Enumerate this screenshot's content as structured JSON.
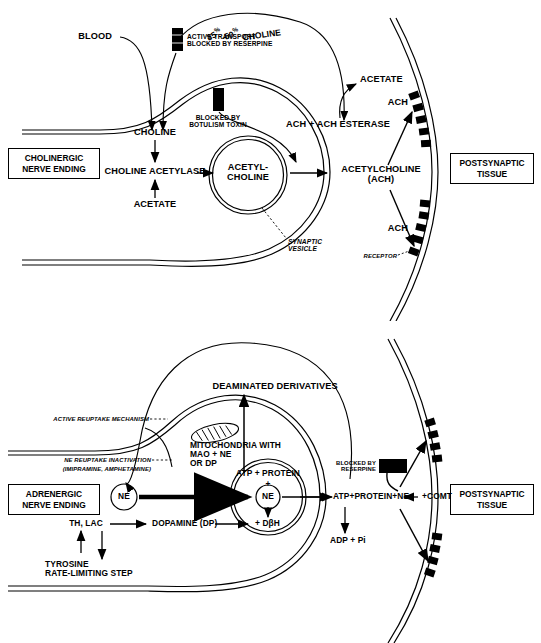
{
  "figure": {
    "type": "biological-diagram",
    "panels": [
      {
        "id": "cholinergic",
        "title_box_left": "CHOLINERGIC\nNERVE ENDING",
        "title_box_right": "POSTSYNAPTIC\nTISSUE",
        "labels": {
          "blood": "BLOOD",
          "choline_percent_prefix": "35",
          "choline_percent_mid": "-50",
          "choline_percent_suffix": " CHOLINE",
          "percent_glyph": "%",
          "active_transport": "ACTIVE TRANSPORT\nBLOCKED BY RESERPINE",
          "blocked_botulism": "BLOCKED BY\nBOTULISM TOXIN",
          "choline": "CHOLINE",
          "choline_acetylase": "CHOLINE ACETYLASE",
          "acetate_left": "ACETATE",
          "acetyl_choline_vesicle": "ACETYL-\nCHOLINE",
          "acetylcholine_ach": "ACETYLCHOLINE\n(ACH)",
          "ach_ach_esterase": "ACH + ACH ESTERASE",
          "acetate_right": "ACETATE",
          "ach_upper": "ACH",
          "ach_lower": "ACH",
          "synaptic_vesicle": "SYNAPTIC\nVESICLE",
          "receptor": "RECEPTOR"
        }
      },
      {
        "id": "adrenergic",
        "title_box_left": "ADRENERGIC\nNERVE ENDING",
        "title_box_right": "POSTSYNAPTIC\nTISSUE",
        "labels": {
          "deaminated_derivatives": "DEAMINATED DERIVATIVES",
          "active_reuptake": "ACTIVE REUPTAKE MECHANISM",
          "ne_reuptake_inactivation": "NE REUPTAKE INACTIVATION",
          "ne_reuptake_drugs": "(IMIPRAMINE, AMPHETAMINE)",
          "mitochondria": "MITOCHONDRIA WITH\nMAO + NE\nOR DP",
          "blocked_reserpine": "BLOCKED BY\nRESERPINE",
          "atp_protein": "ATP + PROTEIN",
          "plus_sign": "+",
          "ne_vesicle": "NE",
          "ne_cytosol": "NE",
          "dbh": "+ DβH",
          "atp_protein_ne_comt": "ATP+PROTEIN+NE",
          "comt": "+COMT",
          "adp_pi": "ADP + Pi",
          "th_lac": "TH, LAC",
          "dopamine": "DOPAMINE (DP)",
          "tyrosine_rate": "TYROSINE\nRATE-LIMITING STEP"
        }
      }
    ]
  },
  "colors": {
    "ink": "#000000",
    "paper": "#ffffff"
  }
}
